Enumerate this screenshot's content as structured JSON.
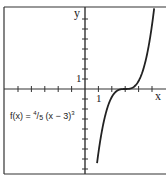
{
  "chart_data": {
    "type": "line",
    "title": "",
    "function": "f(x) = 4/5 (x - 3)^3",
    "xlabel": "x",
    "ylabel": "y",
    "x_tick_label": "1",
    "y_tick_label": "1",
    "xlim": [
      -6.3,
      6.0
    ],
    "ylim": [
      -8.5,
      8.2
    ],
    "grid": false,
    "series": [
      {
        "name": "f(x) = 4/5 (x - 3)^3",
        "x": [
          0.98,
          1.5,
          2.0,
          2.5,
          3.0,
          3.5,
          4.0,
          4.5,
          5.0,
          5.2
        ],
        "y": [
          -6.6,
          -2.7,
          -0.8,
          -0.1,
          0,
          0.1,
          0.8,
          2.7,
          6.4,
          8.5
        ]
      }
    ]
  },
  "labels": {
    "x_axis": "x",
    "y_axis": "y",
    "x_one": "1",
    "y_one": "1",
    "eq_prefix": "f(x) = ",
    "eq_num": "4",
    "eq_slash": "/",
    "eq_den": "5",
    "eq_body": " (x − 3)",
    "eq_exp": "3"
  }
}
